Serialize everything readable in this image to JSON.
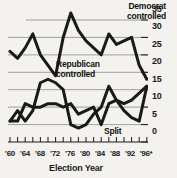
{
  "chart_data": {
    "type": "line",
    "title": "",
    "xlabel": "Election Year",
    "ylabel": "",
    "ylim": [
      0,
      35
    ],
    "yticks": [
      0,
      5,
      10,
      15,
      20,
      25,
      30,
      35
    ],
    "grid": true,
    "legend_position": "inline-annotations",
    "categories": [
      "'60",
      "'62",
      "'64",
      "'66",
      "'68",
      "'70",
      "'72",
      "'74",
      "'76",
      "'78",
      "'80",
      "'82",
      "'84",
      "'86",
      "'88",
      "'90",
      "'92",
      "'94",
      "'96*"
    ],
    "xtick_labels": [
      "'60",
      "'64",
      "'68",
      "'72",
      "'76",
      "'80",
      "'84",
      "'88",
      "'92",
      "'96*"
    ],
    "x": [
      1960,
      1962,
      1964,
      1966,
      1968,
      1970,
      1972,
      1974,
      1976,
      1978,
      1980,
      1982,
      1984,
      1986,
      1988,
      1990,
      1992,
      1994,
      1996
    ],
    "series": [
      {
        "name": "Democrat controlled",
        "values": [
          26,
          24,
          27,
          31,
          25,
          22,
          19,
          30,
          37,
          32,
          29,
          27,
          25,
          31,
          28,
          29,
          30,
          22,
          18
        ]
      },
      {
        "name": "Republican controlled",
        "values": [
          6,
          9,
          6,
          9,
          17,
          18,
          17,
          15,
          5,
          4,
          5,
          8,
          10,
          16,
          12,
          9,
          7,
          6,
          16
        ]
      },
      {
        "name": "Split",
        "values": [
          6,
          6,
          11,
          10,
          10,
          11,
          11,
          10,
          11,
          8,
          9,
          10,
          5,
          11,
          12,
          11,
          12,
          14,
          16
        ]
      }
    ],
    "annotations": [
      {
        "text": "Democrat controlled",
        "series": "Democrat controlled"
      },
      {
        "text": "Republican controlled",
        "series": "Republican controlled"
      },
      {
        "text": "Split",
        "series": "Split"
      }
    ]
  },
  "labels": {
    "democrat_line1": "Democrat",
    "democrat_line2": "controlled",
    "republican_line1": "Republican",
    "republican_line2": "controlled",
    "split": "Split",
    "axis_title": "Election Year"
  },
  "yticks": {
    "t0": "0",
    "t1": "5",
    "t2": "10",
    "t3": "15",
    "t4": "20",
    "t5": "25",
    "t6": "30",
    "t7": "35"
  },
  "xticks": {
    "x0": "'60",
    "x1": "'64",
    "x2": "'68",
    "x3": "'72",
    "x4": "'76",
    "x5": "'80",
    "x6": "'84",
    "x7": "'88",
    "x8": "'92",
    "x9": "'96*"
  },
  "colors": {
    "background": "#f4f2ef",
    "line": "#1a1a1a",
    "grid": "#8a8a8a",
    "text": "#1a1a1a"
  }
}
